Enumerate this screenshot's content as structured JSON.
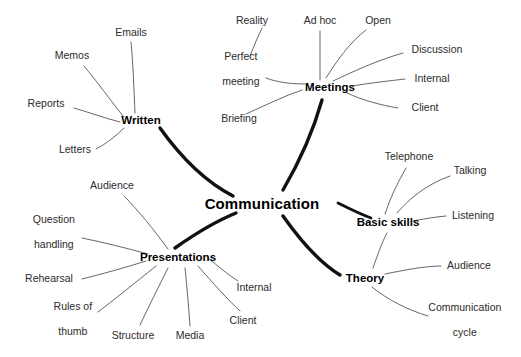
{
  "diagram": {
    "type": "mind-map",
    "title": "Communication",
    "background_color": "#ffffff",
    "root": {
      "label": "Communication",
      "x": 262,
      "y": 204
    },
    "styles": {
      "main_branch_color": "#111111",
      "sub_branch_color": "#555555",
      "text_color": "#1a1a1a"
    },
    "branches": [
      {
        "label": "Written",
        "x": 141,
        "y": 120,
        "children": [
          {
            "label": "Emails",
            "x": 131,
            "y": 33
          },
          {
            "label": "Memos",
            "x": 72,
            "y": 56
          },
          {
            "label": "Reports",
            "x": 46,
            "y": 104
          },
          {
            "label": "Letters",
            "x": 75,
            "y": 150
          }
        ]
      },
      {
        "label": "Meetings",
        "x": 330,
        "y": 87,
        "children": [
          {
            "label": "Reality",
            "x": 252,
            "y": 21
          },
          {
            "label": "Perfect meeting",
            "x": 235,
            "y": 68,
            "lines": [
              "Perfect",
              "meeting"
            ]
          },
          {
            "label": "Briefing",
            "x": 239,
            "y": 119
          },
          {
            "label": "Ad hoc",
            "x": 320,
            "y": 21
          },
          {
            "label": "Open",
            "x": 378,
            "y": 21
          },
          {
            "label": "Discussion",
            "x": 437,
            "y": 50
          },
          {
            "label": "Internal",
            "x": 432,
            "y": 79
          },
          {
            "label": "Client",
            "x": 425,
            "y": 108
          }
        ]
      },
      {
        "label": "Basic skills",
        "x": 388,
        "y": 222,
        "children": [
          {
            "label": "Telephone",
            "x": 409,
            "y": 157
          },
          {
            "label": "Talking",
            "x": 470,
            "y": 171
          },
          {
            "label": "Listening",
            "x": 473,
            "y": 216
          }
        ]
      },
      {
        "label": "Theory",
        "x": 365,
        "y": 278,
        "children": [
          {
            "label": "Audience",
            "x": 469,
            "y": 266
          },
          {
            "label": "Communication cycle",
            "x": 459,
            "y": 319,
            "lines": [
              "Communication",
              "cycle"
            ]
          }
        ]
      },
      {
        "label": "Presentations",
        "x": 178,
        "y": 257,
        "children": [
          {
            "label": "Audience",
            "x": 112,
            "y": 186
          },
          {
            "label": "Question handling",
            "x": 48,
            "y": 231,
            "lines": [
              "Question",
              "handling"
            ]
          },
          {
            "label": "Rehearsal",
            "x": 49,
            "y": 279
          },
          {
            "label": "Rules of thumb",
            "x": 67,
            "y": 318,
            "lines": [
              "Rules of",
              "thumb"
            ]
          },
          {
            "label": "Structure",
            "x": 133,
            "y": 336
          },
          {
            "label": "Media",
            "x": 190,
            "y": 336
          },
          {
            "label": "Internal",
            "x": 254,
            "y": 288
          },
          {
            "label": "Client",
            "x": 243,
            "y": 321
          }
        ]
      }
    ]
  }
}
